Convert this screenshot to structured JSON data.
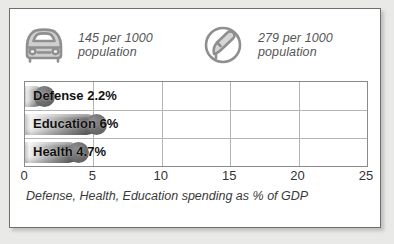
{
  "stats": [
    {
      "icon": "car-icon",
      "value": "145 per 1000",
      "unit": "population",
      "text": "145 per 1000\npopulation"
    },
    {
      "icon": "telephone-icon",
      "value": "279 per 1000",
      "unit": "population",
      "text": "279 per 1000\npopulation"
    }
  ],
  "chart_data": {
    "type": "bar",
    "orientation": "horizontal",
    "title": "",
    "caption": "Defense, Health, Education spending as % of GDP",
    "categories": [
      "Defense",
      "Education",
      "Health"
    ],
    "values": [
      2.2,
      6,
      4.7
    ],
    "value_labels": [
      "2.2%",
      "6%",
      "4.7%"
    ],
    "bar_labels": [
      "Defense 2.2%",
      "Education 6%",
      "Health 4.7%"
    ],
    "xlabel": "",
    "ylabel": "",
    "xlim": [
      0,
      25
    ],
    "xticks": [
      0,
      5,
      10,
      15,
      20,
      25
    ],
    "xtick_labels": [
      "0",
      "5",
      "10",
      "15",
      "20",
      "25"
    ],
    "grid": true,
    "legend": "none",
    "series": [
      {
        "name": "spending as % of GDP",
        "values": [
          2.2,
          6,
          4.7
        ]
      }
    ]
  },
  "colors": {
    "page_background": "#e9e9e7",
    "card_background": "#ffffff",
    "card_border": "#6e6e6e",
    "bar_dark": "#5e5e5e",
    "bar_light": "#f2f2f2",
    "gridline": "#b4b4b4",
    "text": "#333333",
    "icon": "#8c8c8c"
  }
}
